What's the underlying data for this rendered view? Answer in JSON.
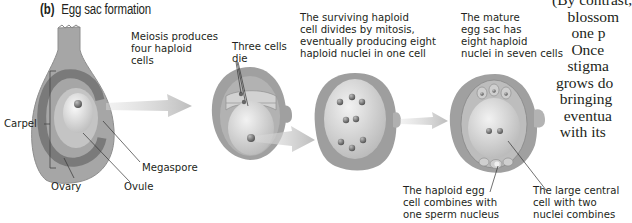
{
  "figure": {
    "panel_label": "(b)",
    "title": "Egg sac formation"
  },
  "steps": [
    {
      "caption": "Meiosis produces\nfour haploid\ncells"
    },
    {
      "caption": "Three cells\ndie"
    },
    {
      "caption": "The surviving haploid\ncell divides by mitosis,\neventually producing eight\nhaploid nuclei in one cell"
    },
    {
      "caption": "The mature\negg sac has\neight haploid\nnuclei in seven cells"
    }
  ],
  "labels": {
    "carpel": "Carpel",
    "ovary": "Ovary",
    "ovule": "Ovule",
    "megaspore": "Megaspore",
    "egg_cell": "The haploid egg\ncell combines with\none sperm nucleus",
    "central_cell": "The large central\ncell with two\nnuclei combines"
  },
  "side_text": {
    "lines": "(By contrast,\n    blossom\n     one p\n     Once\n    stigma\n grows do\n  bringing\n   eventua\n  with its "
  },
  "colors": {
    "carpel_outer": "#a9a9a9",
    "carpel_dark_ring": "#7d7d7d",
    "ovule_light": "#c8c8c8",
    "megaspore": "#e6e6e6",
    "arrow": "#c9c9c9",
    "nucleus": "#6f6f6f"
  }
}
